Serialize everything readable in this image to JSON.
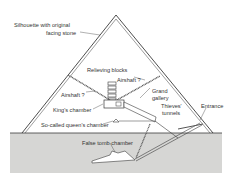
{
  "diagram": {
    "colors": {
      "ground": "#d6d6d4",
      "line": "#3a3a3a",
      "background": "#ffffff"
    },
    "labels": {
      "silhouette_1": "Silhouette with original",
      "silhouette_2": "facing stone",
      "relieving": "Relieving blocks",
      "airshaft_right": "Airshaft ?",
      "airshaft_left": "Airshaft ?",
      "grand_1": "Grand",
      "grand_2": "gallery",
      "kings": "King's chamber",
      "thieves_1": "Thieves'",
      "thieves_2": "tunnels",
      "entrance": "Entrance",
      "queens": "So-called queen's chamber",
      "false_tomb": "False tomb chamber"
    }
  }
}
